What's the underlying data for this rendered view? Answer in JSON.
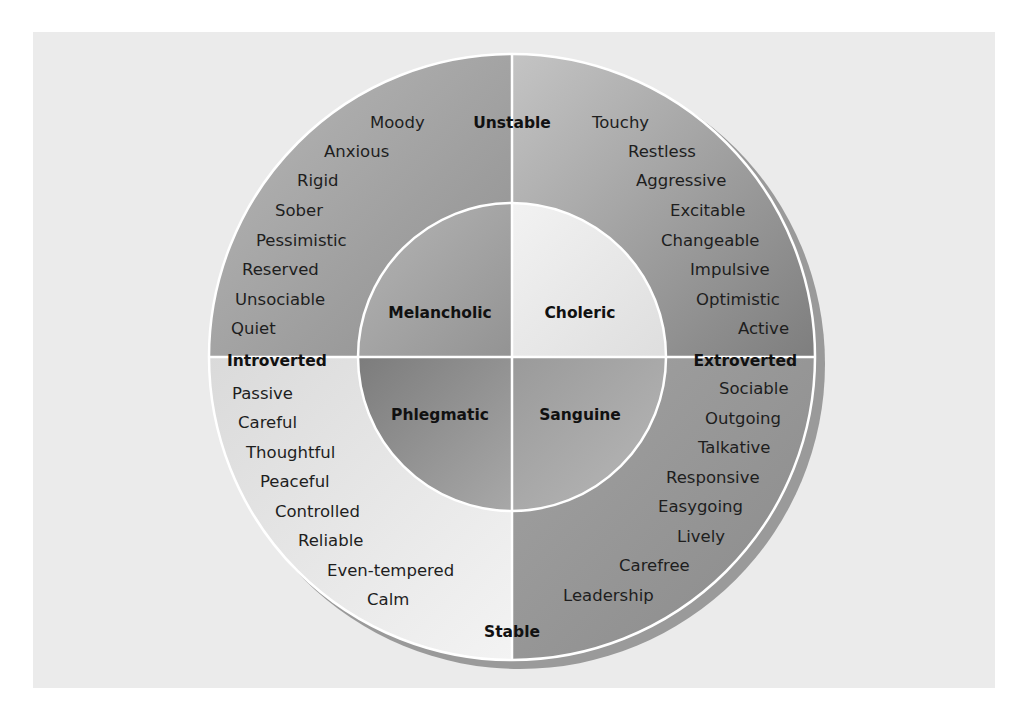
{
  "diagram": {
    "type": "circumplex",
    "axes": {
      "top": "Unstable",
      "bottom": "Stable",
      "left": "Introverted",
      "right": "Extroverted"
    },
    "temperaments": {
      "top_left": "Melancholic",
      "top_right": "Choleric",
      "bottom_left": "Phlegmatic",
      "bottom_right": "Sanguine"
    },
    "traits": {
      "top_left": [
        "Moody",
        "Anxious",
        "Rigid",
        "Sober",
        "Pessimistic",
        "Reserved",
        "Unsociable",
        "Quiet"
      ],
      "top_right": [
        "Touchy",
        "Restless",
        "Aggressive",
        "Excitable",
        "Changeable",
        "Impulsive",
        "Optimistic",
        "Active"
      ],
      "bottom_left": [
        "Passive",
        "Careful",
        "Thoughtful",
        "Peaceful",
        "Controlled",
        "Reliable",
        "Even-tempered",
        "Calm"
      ],
      "bottom_right": [
        "Sociable",
        "Outgoing",
        "Talkative",
        "Responsive",
        "Easygoing",
        "Lively",
        "Carefree",
        "Leadership"
      ]
    },
    "colors": {
      "panel": "#ebebeb",
      "outer_top_left": "#9c9c9c",
      "outer_top_right": "#a8a8a8",
      "outer_bottom_left": "#e2e2e2",
      "outer_bottom_right": "#959595",
      "inner_top_left": "#a5a5a5",
      "inner_top_right": "#e6e6e6",
      "inner_bottom_left": "#8e8e8e",
      "inner_bottom_right": "#a9a9a9",
      "divider": "#ffffff",
      "shadow": "#9a9a9a"
    }
  }
}
